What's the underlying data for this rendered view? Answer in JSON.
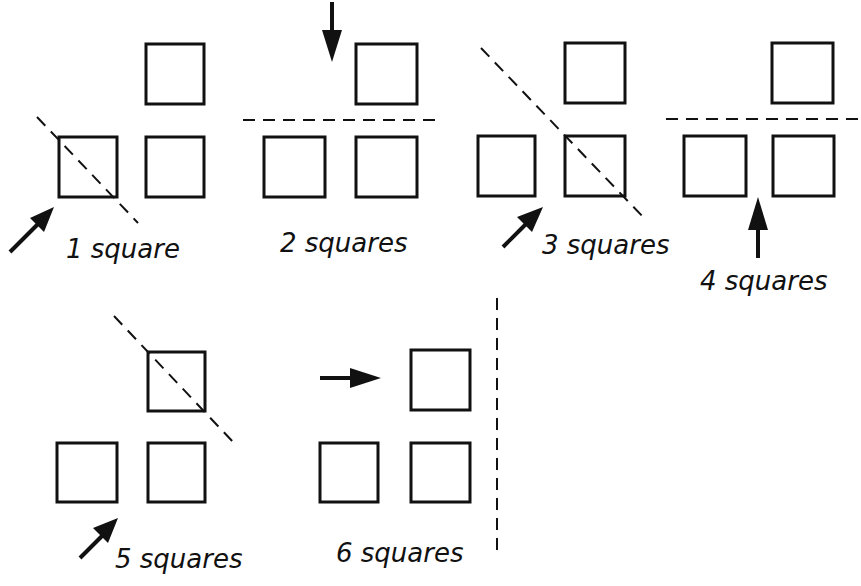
{
  "figure": {
    "panels": [
      {
        "id": 1,
        "label": "1 square",
        "cut": "diagonal through bottom-left square",
        "arrow": "up-right toward bottom-left square"
      },
      {
        "id": 2,
        "label": "2 squares",
        "cut": "horizontal between top and bottom rows",
        "arrow": "down toward top row"
      },
      {
        "id": 3,
        "label": "3 squares",
        "cut": "diagonal through bottom-right square",
        "arrow": "up-right toward gap"
      },
      {
        "id": 4,
        "label": "4 squares",
        "cut": "horizontal between rows",
        "arrow": "up toward gap between bottom squares"
      },
      {
        "id": 5,
        "label": "5 squares",
        "cut": "diagonal through top square",
        "arrow": "up-right toward gap"
      },
      {
        "id": 6,
        "label": "6 squares",
        "cut": "vertical to the right of all squares",
        "arrow": "right toward top square"
      }
    ]
  },
  "labels": {
    "p1": "1 square",
    "p2": "2 squares",
    "p3": "3 squares",
    "p4": "4 squares",
    "p5": "5 squares",
    "p6": "6 squares"
  },
  "colors": {
    "ink": "#111111",
    "paper": "#ffffff"
  }
}
